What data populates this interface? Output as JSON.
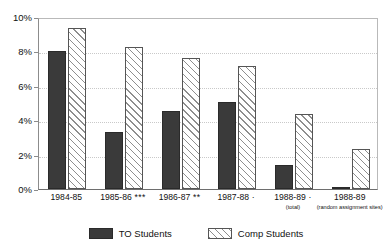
{
  "chart_data": {
    "type": "bar",
    "title": "",
    "subtitle": "",
    "xlabel": "",
    "ylabel": "",
    "ylim": [
      0,
      10
    ],
    "yticks": [
      "0%",
      "2%",
      "4%",
      "6%",
      "8%",
      "10%"
    ],
    "ytick_values": [
      0,
      2,
      4,
      6,
      8,
      10
    ],
    "grid": true,
    "legend_position": "bottom",
    "categories": [
      "1984-85",
      "1985-86",
      "1986-87",
      "1987-88",
      "1988-89",
      "1988-89"
    ],
    "category_significance": [
      "",
      "***",
      "**",
      "·",
      "·",
      ""
    ],
    "category_sublabels": [
      "",
      "",
      "",
      "",
      "(total)",
      "(random assignment sites)"
    ],
    "series": [
      {
        "name": "TO Students",
        "pattern": "solid",
        "color": "#3a3a3a",
        "values": [
          8.0,
          3.3,
          4.55,
          5.05,
          1.4,
          0.1
        ]
      },
      {
        "name": "Comp Students",
        "pattern": "diagonal-hatch",
        "color": "#ffffff",
        "values": [
          9.35,
          8.25,
          7.6,
          7.15,
          4.35,
          2.35
        ]
      }
    ]
  },
  "legend": {
    "items": [
      {
        "label": "TO Students"
      },
      {
        "label": "Comp Students"
      }
    ]
  },
  "colors": {
    "series_to": "#3a3a3a",
    "series_comp_hatch": "#8e8e8e",
    "gridline": "#c9c9c9",
    "axis": "#6e6e6e",
    "text": "#111111"
  }
}
